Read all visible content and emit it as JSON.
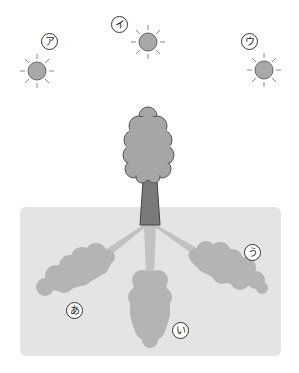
{
  "diagram": {
    "type": "sun-position and tree shadow illustration",
    "colors": {
      "background": "#ffffff",
      "ground": "#e4e4e4",
      "sun_fill": "#a8a8a8",
      "sun_ray": "#8a8a8a",
      "crown": "#a6a6a6",
      "trunk": "#7a7a7a",
      "shadow": "#b4b4b4",
      "outline": "#555555"
    },
    "suns": [
      {
        "label": "ア",
        "cx": 37,
        "cy": 71
      },
      {
        "label": "イ",
        "cx": 148,
        "cy": 42
      },
      {
        "label": "ウ",
        "cx": 264,
        "cy": 70
      }
    ],
    "shadows": [
      {
        "label": "あ"
      },
      {
        "label": "い"
      },
      {
        "label": "う"
      }
    ]
  }
}
